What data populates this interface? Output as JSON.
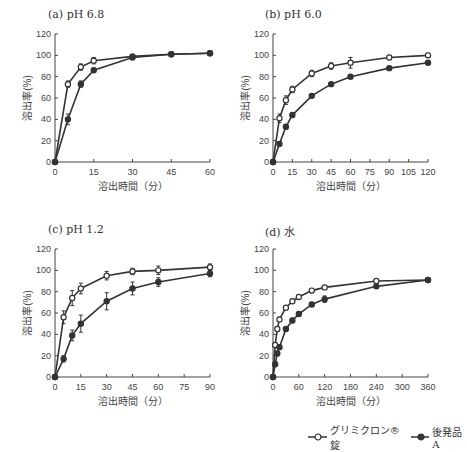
{
  "chart_data": [
    {
      "id": "a",
      "type": "line",
      "title": "(a) pH 6.8",
      "xlabel": "溶出時間（分）",
      "ylabel": "溶出率(%)",
      "xlim": [
        0,
        60
      ],
      "ylim": [
        0,
        120
      ],
      "xticks": [
        0,
        15,
        30,
        45,
        60
      ],
      "yticks": [
        0,
        20,
        40,
        60,
        80,
        100,
        120
      ],
      "series": [
        {
          "name": "グリミクロン®錠",
          "marker": "open-circle",
          "x": [
            0,
            5,
            10,
            15,
            30,
            45,
            60
          ],
          "values": [
            0,
            73,
            89,
            95,
            99,
            101,
            102
          ],
          "err": [
            0,
            3,
            3,
            3,
            1,
            1,
            1
          ]
        },
        {
          "name": "後発品A",
          "marker": "filled-circle",
          "x": [
            0,
            5,
            10,
            15,
            30,
            45,
            60
          ],
          "values": [
            0,
            40,
            73,
            86,
            98,
            101,
            102
          ],
          "err": [
            0,
            5,
            3,
            2,
            1,
            1,
            1
          ]
        }
      ]
    },
    {
      "id": "b",
      "type": "line",
      "title": "(b) pH 6.0",
      "xlabel": "溶出時間（分）",
      "ylabel": "溶出率(%)",
      "xlim": [
        0,
        120
      ],
      "ylim": [
        0,
        120
      ],
      "xticks": [
        0,
        15,
        30,
        45,
        60,
        75,
        90,
        105,
        120
      ],
      "yticks": [
        0,
        20,
        40,
        60,
        80,
        100,
        120
      ],
      "series": [
        {
          "name": "グリミクロン®錠",
          "marker": "open-circle",
          "x": [
            0,
            5,
            10,
            15,
            30,
            45,
            60,
            90,
            120
          ],
          "values": [
            0,
            41,
            58,
            68,
            83,
            90,
            93,
            98,
            100
          ],
          "err": [
            0,
            4,
            4,
            3,
            3,
            3,
            5,
            2,
            2
          ]
        },
        {
          "name": "後発品A",
          "marker": "filled-circle",
          "x": [
            0,
            5,
            10,
            15,
            30,
            45,
            60,
            90,
            120
          ],
          "values": [
            0,
            17,
            33,
            44,
            62,
            73,
            80,
            88,
            93
          ],
          "err": [
            0,
            2,
            2,
            1,
            1,
            1,
            1,
            1,
            1
          ]
        }
      ]
    },
    {
      "id": "c",
      "type": "line",
      "title": "(c) pH 1.2",
      "xlabel": "溶出時間（分）",
      "ylabel": "溶出率(%)",
      "xlim": [
        0,
        90
      ],
      "ylim": [
        0,
        120
      ],
      "xticks": [
        0,
        15,
        30,
        45,
        60,
        75,
        90
      ],
      "yticks": [
        0,
        20,
        40,
        60,
        80,
        100,
        120
      ],
      "series": [
        {
          "name": "グリミクロン®錠",
          "marker": "open-circle",
          "x": [
            0,
            5,
            10,
            15,
            30,
            45,
            60,
            90
          ],
          "values": [
            0,
            56,
            74,
            83,
            95,
            99,
            100,
            103
          ],
          "err": [
            0,
            6,
            7,
            5,
            4,
            3,
            4,
            3
          ]
        },
        {
          "name": "後発品A",
          "marker": "filled-circle",
          "x": [
            0,
            5,
            10,
            15,
            30,
            45,
            60,
            90
          ],
          "values": [
            0,
            17,
            39,
            50,
            71,
            83,
            89,
            97
          ],
          "err": [
            0,
            3,
            5,
            8,
            8,
            6,
            4,
            3
          ]
        }
      ]
    },
    {
      "id": "d",
      "type": "line",
      "title": "(d) 水",
      "xlabel": "溶出時間（分）",
      "ylabel": "溶出率(%)",
      "xlim": [
        0,
        360
      ],
      "ylim": [
        0,
        120
      ],
      "xticks": [
        0,
        60,
        120,
        180,
        240,
        300,
        360
      ],
      "yticks": [
        0,
        20,
        40,
        60,
        80,
        100,
        120
      ],
      "series": [
        {
          "name": "グリミクロン®錠",
          "marker": "open-circle",
          "x": [
            0,
            5,
            10,
            15,
            30,
            45,
            60,
            90,
            120,
            240,
            360
          ],
          "values": [
            0,
            30,
            45,
            54,
            65,
            71,
            75,
            81,
            84,
            90,
            91
          ],
          "err": [
            0,
            2,
            2,
            2,
            2,
            2,
            2,
            2,
            1,
            1,
            1
          ]
        },
        {
          "name": "後発品A",
          "marker": "filled-circle",
          "x": [
            0,
            5,
            10,
            15,
            30,
            45,
            60,
            90,
            120,
            240,
            360
          ],
          "values": [
            0,
            12,
            22,
            28,
            45,
            53,
            59,
            68,
            73,
            85,
            91
          ],
          "err": [
            0,
            2,
            2,
            2,
            2,
            2,
            2,
            2,
            3,
            2,
            2
          ]
        }
      ]
    }
  ],
  "legend": {
    "items": [
      {
        "label": "グリミクロン®錠",
        "marker": "open-circle"
      },
      {
        "label": "後発品A",
        "marker": "filled-circle"
      }
    ]
  },
  "colors": {
    "line": "#333333",
    "axis": "#444444",
    "background": "#ffffff"
  }
}
